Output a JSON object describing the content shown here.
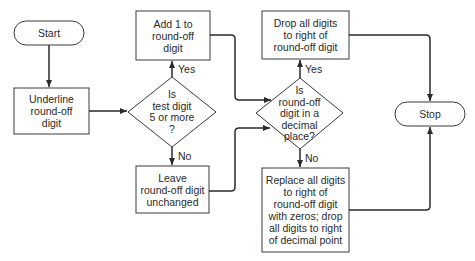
{
  "diagram": {
    "type": "flowchart",
    "nodes": {
      "start": {
        "shape": "terminal",
        "lines": [
          "Start"
        ]
      },
      "underline": {
        "shape": "process",
        "lines": [
          "Underline",
          "round-off",
          "digit"
        ]
      },
      "test": {
        "shape": "decision",
        "lines": [
          "Is",
          "test digit",
          "5 or more",
          "?"
        ]
      },
      "add": {
        "shape": "process",
        "lines": [
          "Add 1 to",
          "round-off",
          "digit"
        ]
      },
      "leave": {
        "shape": "process",
        "lines": [
          "Leave",
          "round-off digit",
          "unchanged"
        ]
      },
      "decimal": {
        "shape": "decision",
        "lines": [
          "Is",
          "round-off",
          "digit in a",
          "decimal",
          "place?"
        ]
      },
      "drop": {
        "shape": "process",
        "lines": [
          "Drop all digits",
          "to right of",
          "round-off digit"
        ]
      },
      "replace": {
        "shape": "process",
        "lines": [
          "Replace all digits",
          "to right of",
          "round-off digit",
          "with zeros; drop",
          "all digits to right",
          "of decimal point"
        ]
      },
      "stop": {
        "shape": "terminal",
        "lines": [
          "Stop"
        ]
      }
    },
    "edge_labels": {
      "test_yes": "Yes",
      "test_no": "No",
      "decimal_yes": "Yes",
      "decimal_no": "No"
    },
    "edges": [
      {
        "from": "start",
        "to": "underline"
      },
      {
        "from": "underline",
        "to": "test"
      },
      {
        "from": "test",
        "to": "add",
        "label": "Yes"
      },
      {
        "from": "test",
        "to": "leave",
        "label": "No"
      },
      {
        "from": "add",
        "to": "decimal"
      },
      {
        "from": "leave",
        "to": "decimal"
      },
      {
        "from": "decimal",
        "to": "drop",
        "label": "Yes"
      },
      {
        "from": "decimal",
        "to": "replace",
        "label": "No"
      },
      {
        "from": "drop",
        "to": "stop"
      },
      {
        "from": "replace",
        "to": "stop"
      }
    ]
  }
}
